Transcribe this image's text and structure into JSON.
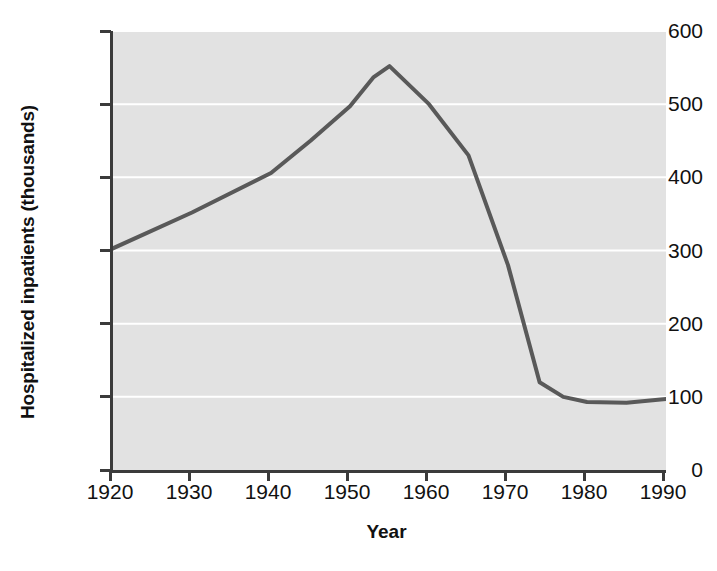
{
  "chart_data": {
    "type": "line",
    "title": "",
    "xlabel": "Year",
    "ylabel": "Hospitalized inpatients (thousands)",
    "xlim": [
      1920,
      1990
    ],
    "ylim": [
      0,
      600
    ],
    "xticks": [
      1920,
      1930,
      1940,
      1950,
      1960,
      1970,
      1980,
      1990
    ],
    "xtick_labels": [
      "1920",
      "1930",
      "1940",
      "1950",
      "1960",
      "1970",
      "1980",
      "1990"
    ],
    "yticks": [
      0,
      100,
      200,
      300,
      400,
      500,
      600
    ],
    "ytick_labels": [
      "0",
      "100",
      "200",
      "300",
      "400",
      "500",
      "600"
    ],
    "grid": "horizontal-white",
    "legend": null,
    "legend_position": "none",
    "plot_background": "#e2e2e2",
    "gridline_color": "#ffffff",
    "axis_color": "#3b3b3b",
    "series": [
      {
        "name": "Hospitalized inpatients",
        "color": "#595959",
        "line_width": 4,
        "x": [
          1920,
          1930,
          1940,
          1945,
          1950,
          1953,
          1955,
          1960,
          1965,
          1970,
          1974,
          1977,
          1980,
          1985,
          1990
        ],
        "values": [
          303,
          352,
          406,
          450,
          497,
          537,
          552,
          500,
          430,
          280,
          120,
          100,
          93,
          92,
          97
        ]
      }
    ]
  },
  "axis_titles": {
    "y": "Hospitalized inpatients (thousands)",
    "x": "Year"
  }
}
